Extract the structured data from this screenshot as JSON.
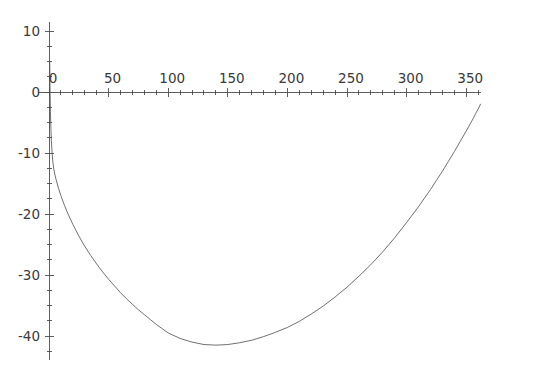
{
  "chart_data": {
    "type": "line",
    "title": "",
    "subtitle": "",
    "xlabel": "",
    "ylabel": "",
    "xlim": [
      -8,
      362
    ],
    "ylim": [
      -44,
      11.5
    ],
    "grid": false,
    "legend": null,
    "axis_origin": [
      0,
      0
    ],
    "x_ticks_major": [
      0,
      50,
      100,
      150,
      200,
      250,
      300,
      350
    ],
    "x_tick_labels": [
      "0",
      "50",
      "100",
      "150",
      "200",
      "250",
      "300",
      "350"
    ],
    "x_ticks_minor_step": 10,
    "y_ticks_major": [
      10,
      0,
      -10,
      -20,
      -30,
      -40
    ],
    "y_tick_labels": [
      "10",
      "0",
      "-10",
      "-20",
      "-30",
      "-40"
    ],
    "y_ticks_minor_step": 2.5,
    "series": [
      {
        "name": "curve",
        "color": "#54565a",
        "points": [
          [
            0.6,
            5.0
          ],
          [
            0.9,
            0.0
          ],
          [
            1.2,
            -3.2
          ],
          [
            1.6,
            -6.0
          ],
          [
            2.0,
            -8.0
          ],
          [
            2.6,
            -10.0
          ],
          [
            3.2,
            -11.4
          ],
          [
            4.0,
            -12.6
          ],
          [
            5.0,
            -13.6
          ],
          [
            6.0,
            -14.4
          ],
          [
            8.0,
            -15.8
          ],
          [
            10.0,
            -17.0
          ],
          [
            13.0,
            -18.6
          ],
          [
            16.0,
            -20.0
          ],
          [
            20.0,
            -21.7
          ],
          [
            25.0,
            -23.6
          ],
          [
            30.0,
            -25.3
          ],
          [
            35.0,
            -26.8
          ],
          [
            40.0,
            -28.2
          ],
          [
            45.0,
            -29.5
          ],
          [
            50.0,
            -30.7
          ],
          [
            55.0,
            -31.8
          ],
          [
            60.0,
            -32.9
          ],
          [
            65.0,
            -33.9
          ],
          [
            70.0,
            -34.8
          ],
          [
            75.0,
            -35.7
          ],
          [
            80.0,
            -36.5
          ],
          [
            85.0,
            -37.3
          ],
          [
            90.0,
            -38.1
          ],
          [
            95.0,
            -38.8
          ],
          [
            100.0,
            -39.5
          ],
          [
            110.0,
            -40.4
          ],
          [
            120.0,
            -41.0
          ],
          [
            130.0,
            -41.4
          ],
          [
            140.0,
            -41.5
          ],
          [
            150.0,
            -41.4
          ],
          [
            160.0,
            -41.1
          ],
          [
            170.0,
            -40.7
          ],
          [
            180.0,
            -40.1
          ],
          [
            190.0,
            -39.4
          ],
          [
            200.0,
            -38.6
          ],
          [
            210.0,
            -37.6
          ],
          [
            220.0,
            -36.4
          ],
          [
            230.0,
            -35.1
          ],
          [
            240.0,
            -33.6
          ],
          [
            250.0,
            -32.0
          ],
          [
            260.0,
            -30.2
          ],
          [
            270.0,
            -28.3
          ],
          [
            280.0,
            -26.2
          ],
          [
            290.0,
            -23.9
          ],
          [
            300.0,
            -21.4
          ],
          [
            310.0,
            -18.8
          ],
          [
            315.0,
            -17.4
          ],
          [
            320.0,
            -16.0
          ],
          [
            325.0,
            -14.5
          ],
          [
            330.0,
            -13.0
          ],
          [
            335.0,
            -11.4
          ],
          [
            340.0,
            -9.8
          ],
          [
            345.0,
            -8.1
          ],
          [
            350.0,
            -6.4
          ],
          [
            352.0,
            -5.7
          ],
          [
            354.0,
            -5.0
          ],
          [
            356.0,
            -4.3
          ],
          [
            358.0,
            -3.5
          ],
          [
            360.0,
            -2.8
          ],
          [
            362.0,
            -2.0
          ]
        ]
      }
    ]
  }
}
